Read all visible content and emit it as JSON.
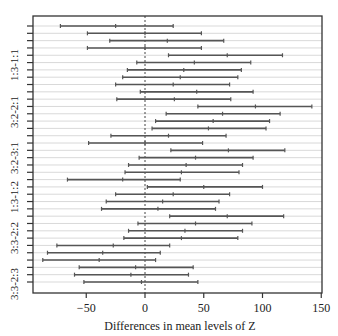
{
  "chart_data": {
    "type": "interval",
    "title": "",
    "xlabel": "Differences in mean levels of Z",
    "ylabel": "",
    "xlim": [
      -97,
      151
    ],
    "xticks": [
      -50,
      0,
      50,
      100,
      150
    ],
    "xtick_labels": [
      "−50",
      "0",
      "50",
      "100",
      "150"
    ],
    "reference_line": 0,
    "grid": "horizontal",
    "y_tick_labels": [
      {
        "label": "1:3-1:1",
        "row": 6
      },
      {
        "label": "3:2-2:1",
        "row": 12
      },
      {
        "label": "3:2-3:1",
        "row": 18
      },
      {
        "label": "1:3-1:2",
        "row": 24
      },
      {
        "label": "3:3-2:2",
        "row": 30
      },
      {
        "label": "3:3-2:3",
        "row": 36
      }
    ],
    "series": [
      {
        "name": "confidence_intervals",
        "rows": [
          {
            "lwr": -72,
            "diff": -25,
            "upr": 24
          },
          {
            "lwr": -49,
            "diff": 0,
            "upr": 48
          },
          {
            "lwr": -30,
            "diff": 19,
            "upr": 67
          },
          {
            "lwr": -49,
            "diff": 0,
            "upr": 48
          },
          {
            "lwr": 20,
            "diff": 70,
            "upr": 117
          },
          {
            "lwr": -7,
            "diff": 42,
            "upr": 90
          },
          {
            "lwr": -15,
            "diff": 33,
            "upr": 82
          },
          {
            "lwr": -19,
            "diff": 30,
            "upr": 79
          },
          {
            "lwr": -25,
            "diff": 24,
            "upr": 72
          },
          {
            "lwr": -4,
            "diff": 44,
            "upr": 92
          },
          {
            "lwr": -24,
            "diff": 25,
            "upr": 73
          },
          {
            "lwr": 45,
            "diff": 94,
            "upr": 142
          },
          {
            "lwr": 18,
            "diff": 66,
            "upr": 115
          },
          {
            "lwr": 9,
            "diff": 58,
            "upr": 106
          },
          {
            "lwr": 6,
            "diff": 54,
            "upr": 103
          },
          {
            "lwr": -29,
            "diff": 20,
            "upr": 69
          },
          {
            "lwr": -48,
            "diff": 0,
            "upr": 49
          },
          {
            "lwr": 22,
            "diff": 71,
            "upr": 119
          },
          {
            "lwr": -5,
            "diff": 43,
            "upr": 92
          },
          {
            "lwr": -14,
            "diff": 35,
            "upr": 83
          },
          {
            "lwr": -17,
            "diff": 31,
            "upr": 80
          },
          {
            "lwr": -66,
            "diff": -19,
            "upr": 30
          },
          {
            "lwr": 2,
            "diff": 50,
            "upr": 100
          },
          {
            "lwr": -25,
            "diff": 24,
            "upr": 72
          },
          {
            "lwr": -33,
            "diff": 15,
            "upr": 63
          },
          {
            "lwr": -37,
            "diff": 11,
            "upr": 60
          },
          {
            "lwr": 21,
            "diff": 70,
            "upr": 118
          },
          {
            "lwr": -6,
            "diff": 43,
            "upr": 91
          },
          {
            "lwr": -14,
            "diff": 34,
            "upr": 83
          },
          {
            "lwr": -18,
            "diff": 31,
            "upr": 79
          },
          {
            "lwr": -75,
            "diff": -27,
            "upr": 21
          },
          {
            "lwr": -83,
            "diff": -36,
            "upr": 13
          },
          {
            "lwr": -87,
            "diff": -39,
            "upr": 9
          },
          {
            "lwr": -56,
            "diff": -8,
            "upr": 41
          },
          {
            "lwr": -60,
            "diff": -12,
            "upr": 37
          },
          {
            "lwr": -52,
            "diff": -3,
            "upr": 45
          }
        ]
      }
    ]
  },
  "colors": {
    "interval": "#555555",
    "grid": "#cfcfcf",
    "frame": "#333333",
    "reference": "#444444"
  }
}
